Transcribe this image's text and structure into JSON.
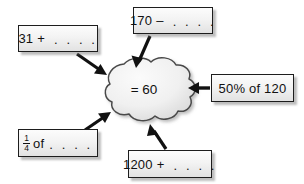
{
  "diagram": {
    "center": {
      "label": "= 60",
      "shape": "cloud"
    },
    "colors": {
      "box_border": "#1d1d1d",
      "box_fill_top": "#fcfcfc",
      "box_fill_bottom": "#e2e2e2",
      "cloud_fill": "#efefef",
      "cloud_border": "#4a4a4a",
      "arrow": "#111111",
      "background": "#ffffff",
      "text": "#111111"
    },
    "dots": ". . . .",
    "boxes": [
      {
        "id": "top",
        "operand": "170",
        "operator": "–",
        "text": "170 – . . . .",
        "arrow": "down-right-into-cloud-top"
      },
      {
        "id": "left",
        "operand": "31",
        "operator": "+",
        "text": "31 + . . . .",
        "arrow": "down-right-into-cloud-upper-left"
      },
      {
        "id": "right",
        "text": "50% of 120",
        "arrow": "left-into-cloud-right"
      },
      {
        "id": "fraction",
        "numerator": "1",
        "denominator": "4",
        "suffix": "of",
        "text": "1/4 of . . . .",
        "arrow": "up-right-into-cloud-lower-left"
      },
      {
        "id": "bottom",
        "operand": "1200",
        "operator": "+",
        "text": "1200 + . . . .",
        "arrow": "up-left-into-cloud-bottom"
      }
    ]
  }
}
